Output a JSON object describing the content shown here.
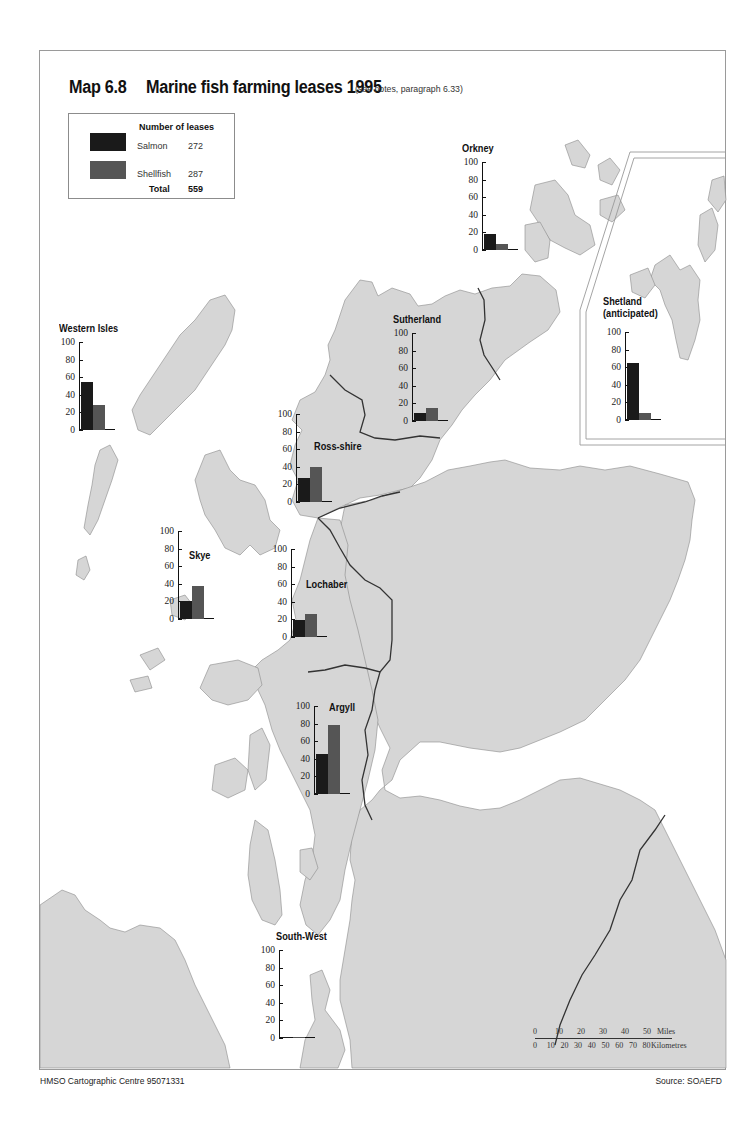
{
  "header": {
    "map_number": "Map 6.8",
    "title": "Marine fish farming leases 1995",
    "note": "(see notes, paragraph 6.33)"
  },
  "legend": {
    "title": "Number of leases",
    "items": [
      {
        "label": "Salmon",
        "value": "272",
        "color": "#1a1a1a"
      },
      {
        "label": "Shellfish",
        "value": "287",
        "color": "#555555"
      }
    ],
    "total_label": "Total",
    "total_value": "559"
  },
  "colors": {
    "land": "#d6d6d6",
    "sea": "#ffffff",
    "boundary": "#333333",
    "salmon": "#1a1a1a",
    "shellfish": "#555555"
  },
  "axis_ticks": [
    "100",
    "80",
    "60",
    "40",
    "20",
    "0"
  ],
  "regions": [
    {
      "name": "Orkney",
      "salmon": 18,
      "shellfish": 7
    },
    {
      "name": "Shetland (anticipated)",
      "salmon": 65,
      "shellfish": 8
    },
    {
      "name": "Western Isles",
      "salmon": 55,
      "shellfish": 28
    },
    {
      "name": "Sutherland",
      "salmon": 9,
      "shellfish": 15
    },
    {
      "name": "Ross-shire",
      "salmon": 27,
      "shellfish": 40
    },
    {
      "name": "Skye",
      "salmon": 21,
      "shellfish": 37
    },
    {
      "name": "Lochaber",
      "salmon": 19,
      "shellfish": 26
    },
    {
      "name": "Argyll",
      "salmon": 46,
      "shellfish": 78
    },
    {
      "name": "South-West",
      "salmon": 1,
      "shellfish": 1
    }
  ],
  "region_labels": {
    "orkney": "Orkney",
    "shetland_1": "Shetland",
    "shetland_2": "(anticipated)",
    "western_isles": "Western Isles",
    "sutherland": "Sutherland",
    "ross_shire": "Ross-shire",
    "skye": "Skye",
    "lochaber": "Lochaber",
    "argyll": "Argyll",
    "south_west": "South-West"
  },
  "scale": {
    "miles_ticks": [
      "0",
      "10",
      "20",
      "30",
      "40",
      "50"
    ],
    "miles_unit": "Miles",
    "km_ticks": [
      "0",
      "10",
      "20",
      "30",
      "40",
      "50",
      "60",
      "70",
      "80"
    ],
    "km_unit": "Kilometres"
  },
  "footer": {
    "left": "HMSO Cartographic Centre 95071331",
    "right": "Source: SOAEFD"
  },
  "chart_data": [
    {
      "type": "bar",
      "title": "Marine fish farming leases 1995 by region",
      "categories": [
        "Orkney",
        "Shetland (anticipated)",
        "Western Isles",
        "Sutherland",
        "Ross-shire",
        "Skye",
        "Lochaber",
        "Argyll",
        "South-West"
      ],
      "series": [
        {
          "name": "Salmon",
          "values": [
            18,
            65,
            55,
            9,
            27,
            21,
            19,
            46,
            1
          ]
        },
        {
          "name": "Shellfish",
          "values": [
            7,
            8,
            28,
            15,
            40,
            37,
            26,
            78,
            1
          ]
        }
      ],
      "xlabel": "",
      "ylabel": "Number of leases",
      "ylim": [
        0,
        100
      ],
      "yticks": [
        0,
        20,
        40,
        60,
        80,
        100
      ],
      "legend": {
        "Salmon": 272,
        "Shellfish": 287,
        "Total": 559
      },
      "grid": false
    }
  ]
}
